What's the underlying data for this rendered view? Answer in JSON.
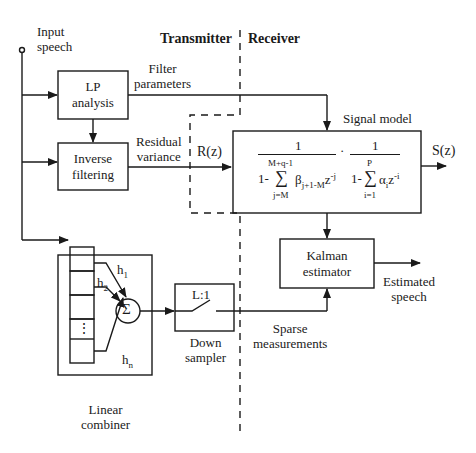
{
  "diagram": {
    "sections": {
      "transmitter": "Transmitter",
      "receiver": "Receiver"
    },
    "input": {
      "label_line1": "Input",
      "label_line2": "speech"
    },
    "blocks": {
      "lp_analysis": {
        "line1": "LP",
        "line2": "analysis"
      },
      "inverse_filtering": {
        "line1": "Inverse",
        "line2": "filtering"
      },
      "signal_model": {
        "title": "Signal model",
        "num1": "1",
        "num2": "1",
        "dot": "·",
        "den1_prefix": "1-",
        "den1_sum_top": "M+q-1",
        "den1_sum": "∑",
        "den1_sum_bottom": "j=M",
        "den1_term": "β",
        "den1_term_sub": "j+1-M",
        "den1_z": "z",
        "den1_z_sup": "-j",
        "den2_prefix": "1-",
        "den2_sum_top": "P",
        "den2_sum": "∑",
        "den2_sum_bottom": "i=1",
        "den2_term": "α",
        "den2_term_sub": "i",
        "den2_z": "z",
        "den2_z_sup": "-i"
      },
      "kalman_estimator": {
        "line1": "Kalman",
        "line2": "estimator"
      },
      "down_sampler": {
        "inner": "L:1",
        "line1": "Down",
        "line2": "sampler"
      },
      "linear_combiner": {
        "line1": "Linear",
        "line2": "combiner",
        "sum_symbol": "Σ",
        "weights": [
          {
            "h": "h",
            "sub": "1"
          },
          {
            "h": "h",
            "sub": "2"
          },
          {
            "h": "h",
            "sub": "n"
          }
        ],
        "ellipsis": "⋮"
      }
    },
    "signals": {
      "filter_parameters": {
        "line1": "Filter",
        "line2": "parameters"
      },
      "residual_variance": {
        "line1": "Residual",
        "line2": "variance"
      },
      "r_z": "R(z)",
      "s_z": "S(z)",
      "estimated_speech": {
        "line1": "Estimated",
        "line2": "speech"
      },
      "sparse_measurements": {
        "line1": "Sparse",
        "line2": "measurements"
      }
    }
  }
}
